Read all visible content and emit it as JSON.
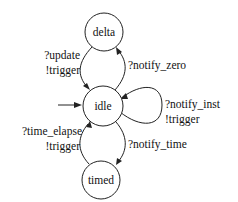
{
  "diagram": {
    "type": "state-machine",
    "initial_state": "idle",
    "states": [
      {
        "id": "delta",
        "label": "delta"
      },
      {
        "id": "idle",
        "label": "idle"
      },
      {
        "id": "timed",
        "label": "timed"
      }
    ],
    "transitions": [
      {
        "from": "delta",
        "to": "idle",
        "label_line1": "?update",
        "label_line2": "!trigger"
      },
      {
        "from": "idle",
        "to": "delta",
        "label_line1": "?notify_zero"
      },
      {
        "from": "idle",
        "to": "idle",
        "label_line1": "?notify_inst",
        "label_line2": "!trigger"
      },
      {
        "from": "timed",
        "to": "idle",
        "label_line1": "?time_elapse",
        "label_line2": "!trigger"
      },
      {
        "from": "idle",
        "to": "timed",
        "label_line1": "?notify_time"
      }
    ]
  }
}
